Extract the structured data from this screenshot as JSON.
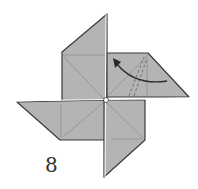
{
  "figure": {
    "step_number": "8",
    "colors": {
      "paper": "#b4b4b4",
      "edge": "#3a3a3a",
      "crease": "#8a8a8a",
      "arrow": "#2a2a2a",
      "background": "#ffffff"
    }
  }
}
